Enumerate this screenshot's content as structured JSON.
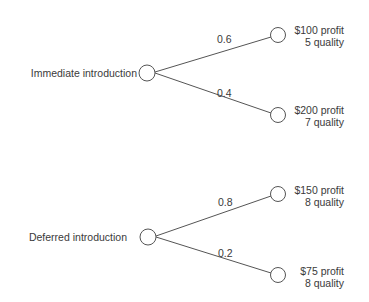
{
  "diagram": {
    "type": "decision-tree",
    "trees": [
      {
        "root_label": "Immediate introduction",
        "branches": [
          {
            "probability": "0.6",
            "profit": "$100 profit",
            "quality": "5 quality"
          },
          {
            "probability": "0.4",
            "profit": "$200 profit",
            "quality": "7 quality"
          }
        ]
      },
      {
        "root_label": "Deferred introduction",
        "branches": [
          {
            "probability": "0.8",
            "profit": "$150 profit",
            "quality": "8 quality"
          },
          {
            "probability": "0.2",
            "profit": "$75 profit",
            "quality": "8 quality"
          }
        ]
      }
    ],
    "colors": {
      "line": "#555555",
      "text": "#3a3a3a",
      "background": "#ffffff"
    }
  }
}
